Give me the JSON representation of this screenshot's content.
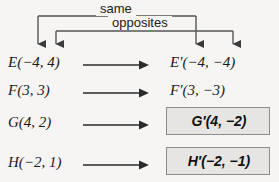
{
  "diagram": {
    "brackets": {
      "same_label": "same",
      "opposites_label": "opposites"
    },
    "colors": {
      "background": "#f6f5f3",
      "ink": "#1b1b1b",
      "bracket_line": "#555555",
      "highlight_fill": "#e6e5e3",
      "highlight_border": "#8c8c8c"
    },
    "rows": [
      {
        "id": "e",
        "preimage": "E(−4, 4)",
        "preimage_letter": "E",
        "preimage_coords": "(−4, 4)",
        "image": "E′(−4, −4)",
        "image_letter": "E′",
        "image_coords": "(−4, −4)",
        "highlighted": false
      },
      {
        "id": "f",
        "preimage": "F(3, 3)",
        "preimage_letter": "F",
        "preimage_coords": "(3, 3)",
        "image": "F′(3, −3)",
        "image_letter": "F′",
        "image_coords": "(3, −3)",
        "highlighted": false
      },
      {
        "id": "g",
        "preimage": "G(4, 2)",
        "preimage_letter": "G",
        "preimage_coords": "(4, 2)",
        "image": "G′(4, −2)",
        "image_letter": "G′",
        "image_coords": "(4, −2)",
        "highlighted": true
      },
      {
        "id": "h",
        "preimage": "H(−2, 1)",
        "preimage_letter": "H",
        "preimage_coords": "(−2, 1)",
        "image": "H′(−2, −1)",
        "image_letter": "H′",
        "image_coords": "(−2, −1)",
        "highlighted": true
      }
    ]
  }
}
